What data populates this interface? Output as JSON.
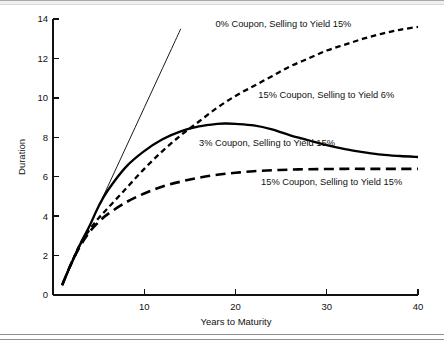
{
  "chart_data": {
    "type": "line",
    "title": "",
    "xlabel": "Years to Maturity",
    "ylabel": "Duration",
    "xlim": [
      0,
      40
    ],
    "ylim": [
      0,
      14
    ],
    "grid": false,
    "legend_position": "inline-annotations",
    "xticks": [
      "10",
      "20",
      "30",
      "40"
    ],
    "xtick_values": [
      10,
      20,
      30,
      40
    ],
    "yticks": [
      "0",
      "2",
      "4",
      "6",
      "8",
      "10",
      "12",
      "14"
    ],
    "ytick_values": [
      0,
      2,
      4,
      6,
      8,
      10,
      12,
      14
    ],
    "series": [
      {
        "name": "0% Coupon, Selling to Yield 15%",
        "style": "solid-thin",
        "x": [
          1,
          2,
          3,
          4,
          5,
          6,
          7,
          8,
          9,
          10,
          11,
          12,
          13,
          14
        ],
        "values": [
          0.5,
          1.5,
          2.5,
          3.5,
          4.5,
          5.5,
          6.5,
          7.5,
          8.5,
          9.5,
          10.5,
          11.5,
          12.5,
          13.5
        ]
      },
      {
        "name": "15% Coupon, Selling to Yield 6%",
        "style": "short-dash",
        "x": [
          1,
          2,
          3,
          4,
          5,
          6,
          8,
          10,
          12,
          14,
          16,
          18,
          20,
          22,
          24,
          26,
          28,
          30,
          32,
          34,
          36,
          38,
          40
        ],
        "values": [
          0.5,
          1.6,
          2.6,
          3.3,
          3.9,
          4.4,
          5.4,
          6.4,
          7.3,
          8.1,
          8.8,
          9.5,
          10.1,
          10.6,
          11.1,
          11.6,
          12.0,
          12.4,
          12.7,
          13.0,
          13.25,
          13.45,
          13.6
        ]
      },
      {
        "name": "3% Coupon, Selling to Yield 15%",
        "style": "solid-thick",
        "x": [
          1,
          2,
          3,
          4,
          5,
          6,
          8,
          10,
          12,
          14,
          16,
          18,
          19,
          20,
          22,
          24,
          26,
          28,
          30,
          32,
          34,
          36,
          38,
          40
        ],
        "values": [
          0.5,
          1.6,
          2.6,
          3.5,
          4.5,
          5.3,
          6.5,
          7.3,
          7.9,
          8.3,
          8.55,
          8.68,
          8.7,
          8.68,
          8.6,
          8.4,
          8.1,
          7.85,
          7.6,
          7.4,
          7.25,
          7.12,
          7.05,
          7.0
        ]
      },
      {
        "name": "15% Coupon, Selling to Yield 15%",
        "style": "long-dash",
        "x": [
          1,
          2,
          3,
          4,
          5,
          6,
          8,
          10,
          12,
          14,
          16,
          18,
          20,
          22,
          24,
          26,
          28,
          30,
          32,
          34,
          36,
          38,
          40
        ],
        "values": [
          0.5,
          1.6,
          2.5,
          3.2,
          3.7,
          4.1,
          4.7,
          5.15,
          5.5,
          5.75,
          5.95,
          6.1,
          6.2,
          6.28,
          6.33,
          6.36,
          6.38,
          6.39,
          6.4,
          6.4,
          6.4,
          6.4,
          6.4
        ]
      }
    ],
    "annotations": [
      {
        "text": "0% Coupon, Selling to Yield 15%",
        "x": 17.8,
        "y": 13.6
      },
      {
        "text": "15% Coupon, Selling to Yield 6%",
        "x": 22.5,
        "y": 10.0
      },
      {
        "text": "3% Coupon, Selling to Yield 15%",
        "x": 16.0,
        "y": 7.55
      },
      {
        "text": "15% Coupon, Selling to Yield 15%",
        "x": 22.8,
        "y": 5.6
      }
    ]
  }
}
